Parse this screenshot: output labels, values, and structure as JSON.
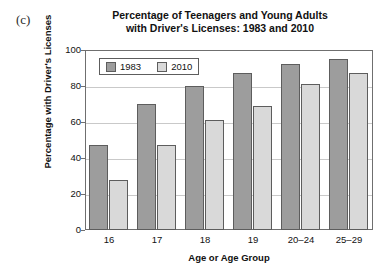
{
  "panel_letter": "(c)",
  "chart_data": {
    "type": "bar",
    "title_line1": "Percentage of Teenagers and Young Adults",
    "title_line2": "with Driver's Licenses: 1983 and 2010",
    "title": "Percentage of Teenagers and Young Adults with Driver's Licenses: 1983 and 2010",
    "xlabel": "Age or Age Group",
    "ylabel": "Percentage with Driver's Licenses",
    "categories": [
      "16",
      "17",
      "18",
      "19",
      "20–24",
      "25–29"
    ],
    "series": [
      {
        "name": "1983",
        "color": "#9d9d9d",
        "values": [
          47,
          70,
          80,
          87,
          92,
          95
        ]
      },
      {
        "name": "2010",
        "color": "#d9d9d9",
        "values": [
          28,
          47,
          61,
          69,
          81,
          87
        ]
      }
    ],
    "ylim": [
      0,
      100
    ],
    "yticks": [
      0,
      20,
      40,
      60,
      80,
      100
    ],
    "grid": true,
    "legend_position": "top-left-inside"
  }
}
